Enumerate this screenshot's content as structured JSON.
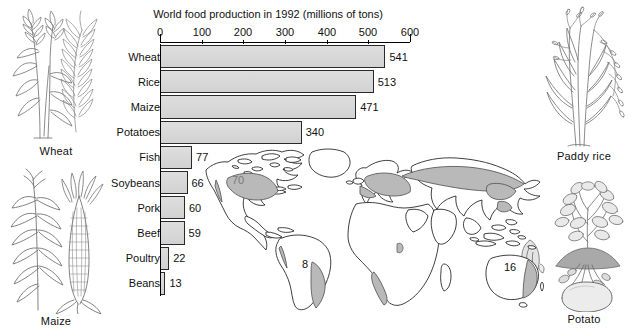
{
  "chart_data": {
    "type": "bar",
    "orientation": "horizontal",
    "title": "World food production in 1992 (millions of tons)",
    "xlabel": "",
    "ylabel": "",
    "xlim": [
      0,
      600
    ],
    "xticks": [
      0,
      100,
      200,
      300,
      400,
      500,
      600
    ],
    "grid": false,
    "legend": "none",
    "categories": [
      "Wheat",
      "Rice",
      "Maize",
      "Potatoes",
      "Fish",
      "Soybeans",
      "Pork",
      "Beef",
      "Poultry",
      "Beans"
    ],
    "values": [
      541,
      513,
      471,
      340,
      77,
      66,
      60,
      59,
      22,
      13
    ],
    "value_labels": [
      "541",
      "513",
      "471",
      "340",
      "77",
      "66",
      "60",
      "59",
      "22",
      "13"
    ],
    "bar_fill": "#d7d7d7",
    "bar_stroke": "#2a2a2a"
  },
  "chart": {
    "title": "World food production in 1992 (millions of tons)",
    "tick_labels": [
      "0",
      "100",
      "200",
      "300",
      "400",
      "500",
      "600"
    ],
    "rows": [
      {
        "name": "Wheat",
        "value": 541,
        "label": "541"
      },
      {
        "name": "Rice",
        "value": 513,
        "label": "513"
      },
      {
        "name": "Maize",
        "value": 471,
        "label": "471"
      },
      {
        "name": "Potatoes",
        "value": 340,
        "label": "340"
      },
      {
        "name": "Fish",
        "value": 77,
        "label": "77"
      },
      {
        "name": "Soybeans",
        "value": 66,
        "label": "66"
      },
      {
        "name": "Pork",
        "value": 60,
        "label": "60"
      },
      {
        "name": "Beef",
        "value": 59,
        "label": "59"
      },
      {
        "name": "Poultry",
        "value": 22,
        "label": "22"
      },
      {
        "name": "Beans",
        "value": 13,
        "label": "13"
      }
    ]
  },
  "map": {
    "annotations": [
      {
        "id": "north-america",
        "label": "70",
        "x": 42,
        "y": 40
      },
      {
        "id": "south-america",
        "label": "8",
        "x": 106,
        "y": 122
      },
      {
        "id": "australia",
        "label": "16",
        "x": 311,
        "y": 125
      }
    ],
    "land_stroke": "#1d1d1d",
    "land_fill": "#ffffff",
    "highlight_fill": "#b9b9b9"
  },
  "illustrations": [
    {
      "id": "wheat",
      "caption": "Wheat"
    },
    {
      "id": "maize",
      "caption": "Maize"
    },
    {
      "id": "paddy-rice",
      "caption": "Paddy rice"
    },
    {
      "id": "potato",
      "caption": "Potato"
    }
  ]
}
